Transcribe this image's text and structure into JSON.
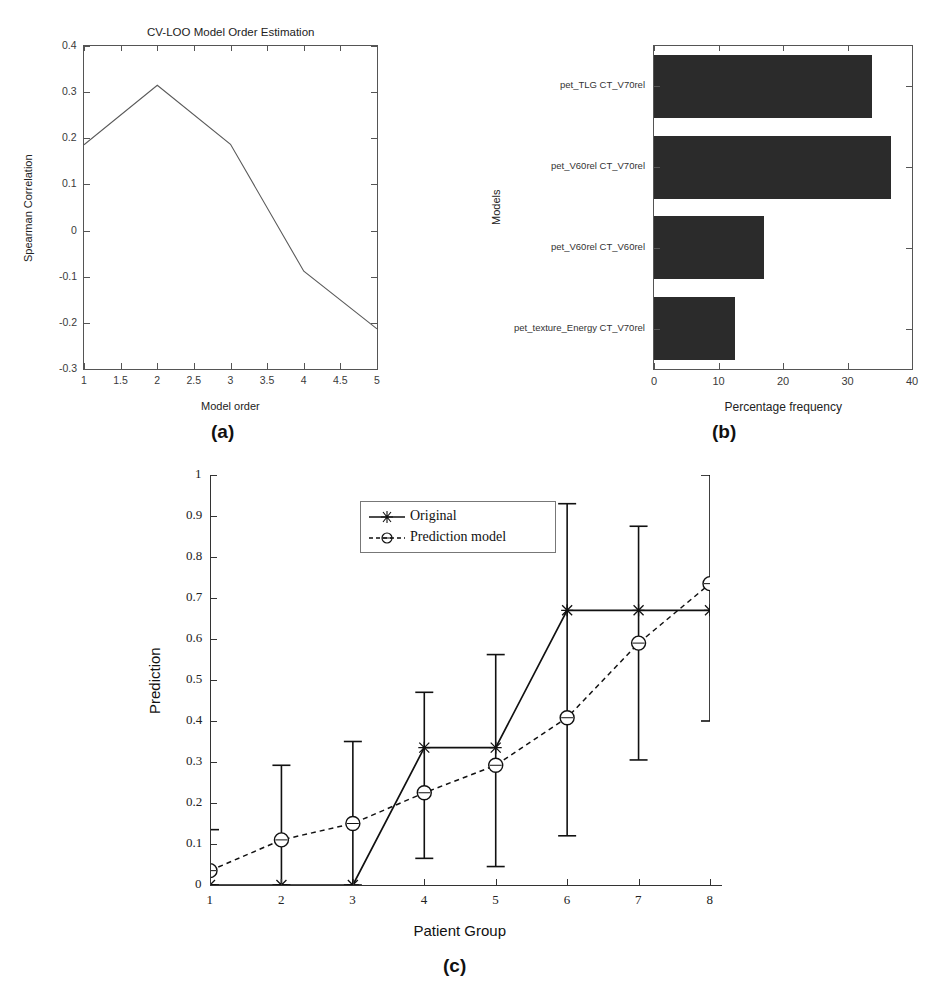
{
  "figure": {
    "captions": {
      "a": "(a)",
      "b": "(b)",
      "c": "(c)"
    }
  },
  "chart_data": [
    {
      "id": "panel_a",
      "type": "line",
      "title": "CV-LOO Model Order Estimation",
      "xlabel": "Model order",
      "ylabel": "Spearman Correlation",
      "xlim": [
        1,
        5
      ],
      "ylim": [
        -0.3,
        0.4
      ],
      "grid": false,
      "legend": "none",
      "xticklabels": [
        "1",
        "1.5",
        "2",
        "2.5",
        "3",
        "3.5",
        "4",
        "4.5",
        "5"
      ],
      "xtickvalues": [
        1,
        1.5,
        2,
        2.5,
        3,
        3.5,
        4,
        4.5,
        5
      ],
      "yticklabels": [
        "0.4",
        "0.3",
        "0.2",
        "0.1",
        "0",
        "-0.1",
        "-0.2",
        "-0.3"
      ],
      "ytickvalues": [
        0.4,
        0.3,
        0.2,
        0.1,
        0,
        -0.1,
        -0.2,
        -0.3
      ],
      "series": [
        {
          "name": "Spearman correlation",
          "x": [
            1,
            2,
            3,
            4,
            5
          ],
          "values": [
            0.186,
            0.315,
            0.187,
            -0.088,
            -0.213
          ]
        }
      ]
    },
    {
      "id": "panel_b",
      "type": "bar",
      "orientation": "horizontal",
      "title": "",
      "xlabel": "Percentage frequency",
      "ylabel": "Models",
      "xlim": [
        0,
        40
      ],
      "grid": false,
      "legend": "none",
      "xticklabels": [
        "0",
        "10",
        "20",
        "30",
        "40"
      ],
      "xtickvalues": [
        0,
        10,
        20,
        30,
        40
      ],
      "categories": [
        "pet_TLG CT_V70rel",
        "pet_V60rel CT_V70rel",
        "pet_V60rel CT_V60rel",
        "pet_texture_Energy CT_V70rel"
      ],
      "values": [
        33.8,
        36.8,
        17.0,
        12.5
      ],
      "bar_color": "#2b2b2b"
    },
    {
      "id": "panel_c",
      "type": "line",
      "title": "",
      "xlabel": "Patient Group",
      "ylabel": "Prediction",
      "xlim": [
        1,
        8
      ],
      "ylim": [
        0,
        1
      ],
      "grid": false,
      "legend": "upper left (inside axes)",
      "xticklabels": [
        "1",
        "2",
        "3",
        "4",
        "5",
        "6",
        "7",
        "8"
      ],
      "xtickvalues": [
        1,
        2,
        3,
        4,
        5,
        6,
        7,
        8
      ],
      "yticklabels": [
        "0",
        "0.1",
        "0.2",
        "0.3",
        "0.4",
        "0.5",
        "0.6",
        "0.7",
        "0.8",
        "0.9",
        "1"
      ],
      "ytickvalues": [
        0,
        0.1,
        0.2,
        0.3,
        0.4,
        0.5,
        0.6,
        0.7,
        0.8,
        0.9,
        1
      ],
      "series": [
        {
          "name": "Original",
          "marker": "star",
          "linestyle": "solid",
          "x": [
            1,
            2,
            3,
            4,
            5,
            6,
            7,
            8
          ],
          "values": [
            0.0,
            0.0,
            0.0,
            0.335,
            0.335,
            0.67,
            0.67,
            0.67
          ]
        },
        {
          "name": "Prediction model",
          "marker": "circle",
          "linestyle": "dashed",
          "x": [
            1,
            2,
            3,
            4,
            5,
            6,
            7,
            8
          ],
          "values": [
            0.035,
            0.11,
            0.15,
            0.225,
            0.292,
            0.408,
            0.59,
            0.735
          ],
          "error_low": [
            0.0,
            0.0,
            0.0,
            0.065,
            0.045,
            0.12,
            0.305,
            0.4
          ],
          "error_high": [
            0.135,
            0.292,
            0.35,
            0.47,
            0.562,
            0.93,
            0.875,
            1.0
          ]
        }
      ]
    }
  ]
}
